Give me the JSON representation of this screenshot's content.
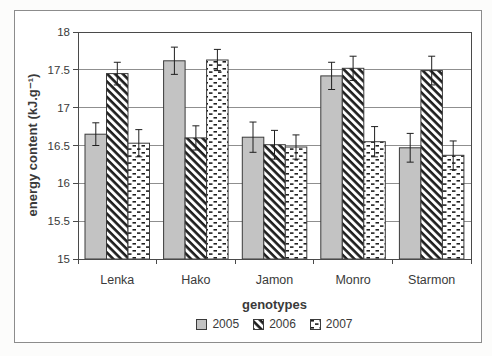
{
  "page": {
    "background": "#fcfcfb"
  },
  "chart_data": {
    "type": "bar",
    "title": "",
    "xlabel": "genotypes",
    "ylabel": "energy content (kJ.g⁻¹)",
    "ylim": [
      15,
      18
    ],
    "ytick_step": 0.5,
    "grid": true,
    "legend_position": "bottom-center",
    "error_bars": true,
    "categories": [
      "Lenka",
      "Hako",
      "Jamon",
      "Monro",
      "Starmon"
    ],
    "series": [
      {
        "name": "2005",
        "style": "solid-gray",
        "values": [
          16.65,
          17.62,
          16.61,
          17.42,
          16.47
        ],
        "errors": [
          0.15,
          0.18,
          0.2,
          0.18,
          0.19
        ]
      },
      {
        "name": "2006",
        "style": "diagonal-hatch",
        "values": [
          17.45,
          16.6,
          16.51,
          17.52,
          17.49
        ],
        "errors": [
          0.15,
          0.16,
          0.19,
          0.16,
          0.19
        ]
      },
      {
        "name": "2007",
        "style": "horizontal-dashes",
        "values": [
          16.53,
          17.63,
          16.48,
          16.55,
          16.37
        ],
        "errors": [
          0.18,
          0.14,
          0.16,
          0.2,
          0.19
        ]
      }
    ],
    "colors": {
      "bar_gray": "#c3c3c3",
      "pattern_ink": "#1f1f1f",
      "bar_stroke": "#3a3a3a",
      "gridline": "#8f8f8f",
      "plot_border": "#4a4a4a",
      "axis_text": "#3a3a3a",
      "frame_border": "#8c8c8c",
      "plot_background": "#ffffff"
    }
  }
}
